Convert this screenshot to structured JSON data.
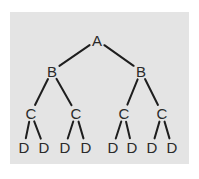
{
  "diagram": {
    "type": "tree",
    "background": "#e4e4e4",
    "line_color": "#1e1e1e",
    "text_color": "#2a2a2a",
    "nodes": [
      {
        "id": "a",
        "label": "A",
        "x": 97,
        "y": 40
      },
      {
        "id": "b1",
        "label": "B",
        "x": 52,
        "y": 71
      },
      {
        "id": "b2",
        "label": "B",
        "x": 141,
        "y": 71
      },
      {
        "id": "c1",
        "label": "C",
        "x": 31,
        "y": 113
      },
      {
        "id": "c2",
        "label": "C",
        "x": 76,
        "y": 113
      },
      {
        "id": "c3",
        "label": "C",
        "x": 124,
        "y": 113
      },
      {
        "id": "c4",
        "label": "C",
        "x": 162,
        "y": 113
      },
      {
        "id": "d1",
        "label": "D",
        "x": 24,
        "y": 147
      },
      {
        "id": "d2",
        "label": "D",
        "x": 44,
        "y": 147
      },
      {
        "id": "d3",
        "label": "D",
        "x": 65,
        "y": 147
      },
      {
        "id": "d4",
        "label": "D",
        "x": 86,
        "y": 147
      },
      {
        "id": "d5",
        "label": "D",
        "x": 113,
        "y": 147
      },
      {
        "id": "d6",
        "label": "D",
        "x": 132,
        "y": 147
      },
      {
        "id": "d7",
        "label": "D",
        "x": 152,
        "y": 147
      },
      {
        "id": "d8",
        "label": "D",
        "x": 172,
        "y": 147
      }
    ],
    "edges": [
      [
        "a",
        "b1"
      ],
      [
        "a",
        "b2"
      ],
      [
        "b1",
        "c1"
      ],
      [
        "b1",
        "c2"
      ],
      [
        "b2",
        "c3"
      ],
      [
        "b2",
        "c4"
      ],
      [
        "c1",
        "d1"
      ],
      [
        "c1",
        "d2"
      ],
      [
        "c2",
        "d3"
      ],
      [
        "c2",
        "d4"
      ],
      [
        "c3",
        "d5"
      ],
      [
        "c3",
        "d6"
      ],
      [
        "c4",
        "d7"
      ],
      [
        "c4",
        "d8"
      ]
    ]
  }
}
